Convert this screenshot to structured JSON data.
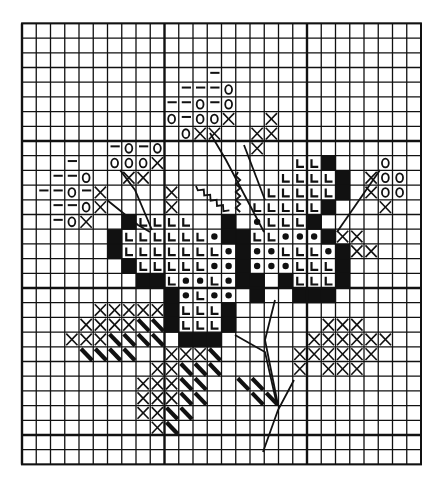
{
  "pattern": {
    "title": "Cross-stitch flower chart",
    "grid": {
      "cols": 28,
      "rows": 30,
      "origin_x": 22,
      "origin_y": 23.4,
      "cell_w": 14.25,
      "cell_h": 14.7,
      "major_every": 10,
      "line_color": "#111111",
      "background": "#ffffff"
    },
    "legend_symbols": [
      {
        "key": "X",
        "name": "cross-stitch"
      },
      {
        "key": "O",
        "name": "circle"
      },
      {
        "key": "-",
        "name": "dash"
      },
      {
        "key": "L",
        "name": "corner-l"
      },
      {
        "key": "*",
        "name": "dot"
      },
      {
        "key": "#",
        "name": "solid"
      },
      {
        "key": "\\",
        "name": "half-stitch"
      }
    ],
    "cells": [
      [
        3,
        13,
        "-"
      ],
      [
        4,
        11,
        "-"
      ],
      [
        4,
        12,
        "-"
      ],
      [
        4,
        13,
        "-"
      ],
      [
        4,
        14,
        "O"
      ],
      [
        5,
        10,
        "-"
      ],
      [
        5,
        11,
        "-"
      ],
      [
        5,
        12,
        "O"
      ],
      [
        5,
        13,
        "-"
      ],
      [
        5,
        14,
        "O"
      ],
      [
        6,
        10,
        "O"
      ],
      [
        6,
        11,
        "-"
      ],
      [
        6,
        12,
        "O"
      ],
      [
        6,
        13,
        "O"
      ],
      [
        6,
        14,
        "X"
      ],
      [
        6,
        17,
        "X"
      ],
      [
        7,
        11,
        "O"
      ],
      [
        7,
        12,
        "X"
      ],
      [
        7,
        13,
        "X"
      ],
      [
        7,
        16,
        "X"
      ],
      [
        7,
        17,
        "X"
      ],
      [
        8,
        6,
        "-"
      ],
      [
        8,
        7,
        "O"
      ],
      [
        8,
        8,
        "-"
      ],
      [
        8,
        9,
        "O"
      ],
      [
        8,
        16,
        "X"
      ],
      [
        9,
        3,
        "-"
      ],
      [
        9,
        6,
        "O"
      ],
      [
        9,
        7,
        "O"
      ],
      [
        9,
        8,
        "O"
      ],
      [
        9,
        9,
        "X"
      ],
      [
        9,
        19,
        "L"
      ],
      [
        9,
        20,
        "L"
      ],
      [
        9,
        21,
        "#"
      ],
      [
        9,
        25,
        "O"
      ],
      [
        10,
        2,
        "-"
      ],
      [
        10,
        3,
        "-"
      ],
      [
        10,
        4,
        "O"
      ],
      [
        10,
        7,
        "X"
      ],
      [
        10,
        8,
        "X"
      ],
      [
        10,
        18,
        "L"
      ],
      [
        10,
        19,
        "L"
      ],
      [
        10,
        20,
        "L"
      ],
      [
        10,
        21,
        "L"
      ],
      [
        10,
        22,
        "#"
      ],
      [
        10,
        24,
        "X"
      ],
      [
        10,
        25,
        "O"
      ],
      [
        10,
        26,
        "O"
      ],
      [
        11,
        1,
        "-"
      ],
      [
        11,
        2,
        "-"
      ],
      [
        11,
        3,
        "O"
      ],
      [
        11,
        4,
        "-"
      ],
      [
        11,
        5,
        "X"
      ],
      [
        11,
        10,
        "X"
      ],
      [
        11,
        17,
        "L"
      ],
      [
        11,
        18,
        "L"
      ],
      [
        11,
        19,
        "L"
      ],
      [
        11,
        20,
        "L"
      ],
      [
        11,
        21,
        "L"
      ],
      [
        11,
        22,
        "#"
      ],
      [
        11,
        24,
        "X"
      ],
      [
        11,
        25,
        "O"
      ],
      [
        11,
        26,
        "O"
      ],
      [
        12,
        2,
        "-"
      ],
      [
        12,
        3,
        "-"
      ],
      [
        12,
        4,
        "O"
      ],
      [
        12,
        5,
        "X"
      ],
      [
        12,
        10,
        "X"
      ],
      [
        12,
        16,
        "L"
      ],
      [
        12,
        17,
        "L"
      ],
      [
        12,
        18,
        "L"
      ],
      [
        12,
        19,
        "L"
      ],
      [
        12,
        20,
        "L"
      ],
      [
        12,
        21,
        "#"
      ],
      [
        12,
        25,
        "X"
      ],
      [
        13,
        2,
        "-"
      ],
      [
        13,
        3,
        "O"
      ],
      [
        13,
        4,
        "X"
      ],
      [
        13,
        7,
        "#"
      ],
      [
        13,
        8,
        "L"
      ],
      [
        13,
        9,
        "L"
      ],
      [
        13,
        10,
        "L"
      ],
      [
        13,
        11,
        "L"
      ],
      [
        13,
        14,
        "#"
      ],
      [
        13,
        16,
        "*"
      ],
      [
        13,
        17,
        "L"
      ],
      [
        13,
        18,
        "L"
      ],
      [
        13,
        19,
        "L"
      ],
      [
        13,
        20,
        "#"
      ],
      [
        14,
        6,
        "#"
      ],
      [
        14,
        7,
        "L"
      ],
      [
        14,
        8,
        "L"
      ],
      [
        14,
        9,
        "L"
      ],
      [
        14,
        10,
        "L"
      ],
      [
        14,
        11,
        "L"
      ],
      [
        14,
        12,
        "L"
      ],
      [
        14,
        13,
        "*"
      ],
      [
        14,
        14,
        "#"
      ],
      [
        14,
        15,
        "#"
      ],
      [
        14,
        16,
        "L"
      ],
      [
        14,
        17,
        "L"
      ],
      [
        14,
        18,
        "*"
      ],
      [
        14,
        19,
        "*"
      ],
      [
        14,
        20,
        "*"
      ],
      [
        14,
        21,
        "#"
      ],
      [
        14,
        22,
        "X"
      ],
      [
        14,
        23,
        "X"
      ],
      [
        15,
        6,
        "#"
      ],
      [
        15,
        7,
        "L"
      ],
      [
        15,
        8,
        "L"
      ],
      [
        15,
        9,
        "L"
      ],
      [
        15,
        10,
        "L"
      ],
      [
        15,
        11,
        "L"
      ],
      [
        15,
        12,
        "L"
      ],
      [
        15,
        13,
        "L"
      ],
      [
        15,
        14,
        "*"
      ],
      [
        15,
        15,
        "#"
      ],
      [
        15,
        16,
        "*"
      ],
      [
        15,
        17,
        "*"
      ],
      [
        15,
        18,
        "L"
      ],
      [
        15,
        19,
        "L"
      ],
      [
        15,
        20,
        "L"
      ],
      [
        15,
        21,
        "*"
      ],
      [
        15,
        22,
        "#"
      ],
      [
        15,
        23,
        "X"
      ],
      [
        15,
        24,
        "X"
      ],
      [
        16,
        7,
        "#"
      ],
      [
        16,
        8,
        "L"
      ],
      [
        16,
        9,
        "L"
      ],
      [
        16,
        10,
        "L"
      ],
      [
        16,
        11,
        "L"
      ],
      [
        16,
        12,
        "L"
      ],
      [
        16,
        13,
        "*"
      ],
      [
        16,
        14,
        "*"
      ],
      [
        16,
        15,
        "#"
      ],
      [
        16,
        16,
        "*"
      ],
      [
        16,
        17,
        "*"
      ],
      [
        16,
        18,
        "*"
      ],
      [
        16,
        19,
        "L"
      ],
      [
        16,
        20,
        "L"
      ],
      [
        16,
        21,
        "L"
      ],
      [
        16,
        22,
        "#"
      ],
      [
        17,
        8,
        "#"
      ],
      [
        17,
        9,
        "#"
      ],
      [
        17,
        10,
        "L"
      ],
      [
        17,
        11,
        "*"
      ],
      [
        17,
        12,
        "*"
      ],
      [
        17,
        13,
        "L"
      ],
      [
        17,
        14,
        "*"
      ],
      [
        17,
        15,
        "#"
      ],
      [
        17,
        16,
        "#"
      ],
      [
        17,
        18,
        "#"
      ],
      [
        17,
        19,
        "L"
      ],
      [
        17,
        20,
        "L"
      ],
      [
        17,
        21,
        "L"
      ],
      [
        17,
        22,
        "#"
      ],
      [
        18,
        10,
        "#"
      ],
      [
        18,
        11,
        "*"
      ],
      [
        18,
        12,
        "L"
      ],
      [
        18,
        13,
        "*"
      ],
      [
        18,
        14,
        "*"
      ],
      [
        18,
        16,
        "#"
      ],
      [
        18,
        19,
        "#"
      ],
      [
        18,
        20,
        "#"
      ],
      [
        18,
        21,
        "#"
      ],
      [
        19,
        5,
        "X"
      ],
      [
        19,
        6,
        "X"
      ],
      [
        19,
        7,
        "X"
      ],
      [
        19,
        8,
        "X"
      ],
      [
        19,
        9,
        "X"
      ],
      [
        19,
        10,
        "#"
      ],
      [
        19,
        11,
        "L"
      ],
      [
        19,
        12,
        "L"
      ],
      [
        19,
        13,
        "L"
      ],
      [
        19,
        14,
        "#"
      ],
      [
        20,
        4,
        "X"
      ],
      [
        20,
        5,
        "X"
      ],
      [
        20,
        6,
        "X"
      ],
      [
        20,
        7,
        "X"
      ],
      [
        20,
        8,
        "\\"
      ],
      [
        20,
        9,
        "\\"
      ],
      [
        20,
        10,
        "#"
      ],
      [
        20,
        11,
        "L"
      ],
      [
        20,
        12,
        "L"
      ],
      [
        20,
        13,
        "L"
      ],
      [
        20,
        14,
        "#"
      ],
      [
        20,
        21,
        "X"
      ],
      [
        20,
        22,
        "X"
      ],
      [
        20,
        23,
        "X"
      ],
      [
        21,
        3,
        "X"
      ],
      [
        21,
        4,
        "X"
      ],
      [
        21,
        5,
        "X"
      ],
      [
        21,
        6,
        "\\"
      ],
      [
        21,
        7,
        "\\"
      ],
      [
        21,
        8,
        "\\"
      ],
      [
        21,
        9,
        "\\"
      ],
      [
        21,
        11,
        "#"
      ],
      [
        21,
        12,
        "#"
      ],
      [
        21,
        13,
        "#"
      ],
      [
        21,
        20,
        "X"
      ],
      [
        21,
        21,
        "X"
      ],
      [
        21,
        22,
        "X"
      ],
      [
        21,
        23,
        "X"
      ],
      [
        21,
        24,
        "X"
      ],
      [
        21,
        25,
        "X"
      ],
      [
        22,
        4,
        "\\"
      ],
      [
        22,
        5,
        "\\"
      ],
      [
        22,
        6,
        "\\"
      ],
      [
        22,
        7,
        "\\"
      ],
      [
        22,
        10,
        "X"
      ],
      [
        22,
        11,
        "X"
      ],
      [
        22,
        12,
        "X"
      ],
      [
        22,
        13,
        "\\"
      ],
      [
        22,
        19,
        "X"
      ],
      [
        22,
        20,
        "X"
      ],
      [
        22,
        21,
        "X"
      ],
      [
        22,
        22,
        "X"
      ],
      [
        22,
        23,
        "X"
      ],
      [
        22,
        24,
        "X"
      ],
      [
        23,
        9,
        "X"
      ],
      [
        23,
        10,
        "X"
      ],
      [
        23,
        11,
        "\\"
      ],
      [
        23,
        12,
        "\\"
      ],
      [
        23,
        13,
        "\\"
      ],
      [
        23,
        19,
        "X"
      ],
      [
        23,
        21,
        "X"
      ],
      [
        23,
        22,
        "X"
      ],
      [
        23,
        23,
        "X"
      ],
      [
        24,
        8,
        "X"
      ],
      [
        24,
        9,
        "X"
      ],
      [
        24,
        10,
        "X"
      ],
      [
        24,
        11,
        "\\"
      ],
      [
        24,
        12,
        "\\"
      ],
      [
        24,
        15,
        "\\"
      ],
      [
        24,
        16,
        "\\"
      ],
      [
        25,
        8,
        "X"
      ],
      [
        25,
        9,
        "X"
      ],
      [
        25,
        10,
        "X"
      ],
      [
        25,
        11,
        "\\"
      ],
      [
        25,
        12,
        "\\"
      ],
      [
        25,
        16,
        "\\"
      ],
      [
        25,
        17,
        "\\"
      ],
      [
        26,
        8,
        "X"
      ],
      [
        26,
        9,
        "X"
      ],
      [
        26,
        10,
        "\\"
      ],
      [
        26,
        11,
        "\\"
      ],
      [
        27,
        9,
        "X"
      ],
      [
        27,
        10,
        "\\"
      ]
    ],
    "stems": [
      {
        "name": "stem-upper-left",
        "points": [
          [
            107,
            200
          ],
          [
            138,
            225
          ],
          [
            150,
            232
          ]
        ]
      },
      {
        "name": "stem-upper-mid",
        "points": [
          [
            120,
            170
          ],
          [
            135,
            190
          ],
          [
            152,
            230
          ]
        ]
      },
      {
        "name": "stem-center-left",
        "points": [
          [
            210,
            133
          ],
          [
            226,
            160
          ],
          [
            264,
            232
          ]
        ]
      },
      {
        "name": "stem-center-right",
        "points": [
          [
            275,
            300
          ],
          [
            265,
            340
          ],
          [
            278,
            405
          ]
        ]
      },
      {
        "name": "stem-lower-left",
        "points": [
          [
            235,
            335
          ],
          [
            265,
            352
          ],
          [
            277,
            405
          ]
        ]
      },
      {
        "name": "stem-lower-right",
        "points": [
          [
            294,
            380
          ],
          [
            278,
            410
          ],
          [
            263,
            452
          ]
        ]
      },
      {
        "name": "stem-right-leaf",
        "points": [
          [
            337,
            232
          ],
          [
            380,
            170
          ]
        ]
      },
      {
        "name": "stem-right-upper",
        "points": [
          [
            244,
            145
          ],
          [
            265,
            200
          ]
        ]
      }
    ],
    "wavy": [
      {
        "name": "tendril-vertical",
        "points": [
          [
            238,
            172
          ],
          [
            238,
            212
          ]
        ]
      },
      {
        "name": "tendril-diagonal",
        "points": [
          [
            196,
            186
          ],
          [
            228,
            212
          ]
        ]
      }
    ]
  }
}
